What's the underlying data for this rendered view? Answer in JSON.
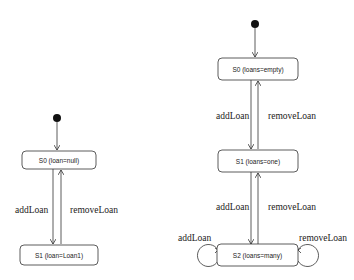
{
  "diagrams": [
    {
      "name": "single-loan",
      "states": [
        {
          "id": "S0",
          "label": "S0 (loan=null)"
        },
        {
          "id": "S1",
          "label": "S1 (loan=Loan1)"
        }
      ],
      "transitions": [
        {
          "from": "S0",
          "to": "S1",
          "label": "addLoan"
        },
        {
          "from": "S1",
          "to": "S0",
          "label": "removeLoan"
        }
      ]
    },
    {
      "name": "multi-loan",
      "states": [
        {
          "id": "S0",
          "label": "S0 (loans=empty)"
        },
        {
          "id": "S1",
          "label": "S1 (loans=one)"
        },
        {
          "id": "S2",
          "label": "S2 (loans=many)"
        }
      ],
      "transitions": [
        {
          "from": "S0",
          "to": "S1",
          "label": "addLoan"
        },
        {
          "from": "S1",
          "to": "S0",
          "label": "removeLoan"
        },
        {
          "from": "S1",
          "to": "S2",
          "label": "addLoan"
        },
        {
          "from": "S2",
          "to": "S1",
          "label": "removeLoan"
        },
        {
          "from": "S2",
          "to": "S2",
          "label": "addLoan"
        },
        {
          "from": "S2",
          "to": "S2",
          "label": "removeLoan"
        }
      ]
    }
  ]
}
